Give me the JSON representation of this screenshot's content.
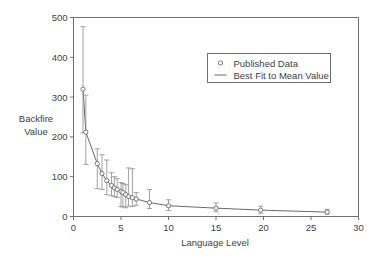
{
  "chart_data": {
    "type": "scatter",
    "title": "",
    "xlabel": "Language Level",
    "ylabel_line1": "Backfire",
    "ylabel_line2": "Value",
    "xlim": [
      0,
      30
    ],
    "ylim": [
      0,
      500
    ],
    "xticks": [
      0,
      5,
      10,
      15,
      20,
      25,
      30
    ],
    "xticklabels": [
      "0",
      "5",
      "10",
      "15",
      "20",
      "25",
      "30"
    ],
    "yticks": [
      0,
      100,
      200,
      300,
      400,
      500
    ],
    "yticklabels": [
      "0",
      "100",
      "200",
      "300",
      "400",
      "500"
    ],
    "grid": false,
    "legend_position": "upper right",
    "legend": [
      {
        "label": "Published Data",
        "marker": "circle-open"
      },
      {
        "label": "Best Fit to Mean Value",
        "marker": "line"
      }
    ],
    "series": [
      {
        "name": "Published Data",
        "marker": "circle-open",
        "points": [
          {
            "x": 1.0,
            "y": 320,
            "ylow": 210,
            "yhigh": 477
          },
          {
            "x": 1.3,
            "y": 212,
            "ylow": 131,
            "yhigh": 305
          },
          {
            "x": 2.5,
            "y": 133,
            "ylow": 70,
            "yhigh": 170
          },
          {
            "x": 3.0,
            "y": 108,
            "ylow": 68,
            "yhigh": 155
          },
          {
            "x": 3.5,
            "y": 90,
            "ylow": 55,
            "yhigh": 142
          },
          {
            "x": 4.0,
            "y": 78,
            "ylow": 52,
            "yhigh": 110
          },
          {
            "x": 4.3,
            "y": 72,
            "ylow": 50,
            "yhigh": 100
          },
          {
            "x": 4.6,
            "y": 68,
            "ylow": 48,
            "yhigh": 95
          },
          {
            "x": 5.0,
            "y": 63,
            "ylow": 25,
            "yhigh": 85
          },
          {
            "x": 5.2,
            "y": 60,
            "ylow": 24,
            "yhigh": 83
          },
          {
            "x": 5.5,
            "y": 55,
            "ylow": 22,
            "yhigh": 80
          },
          {
            "x": 5.8,
            "y": 50,
            "ylow": 26,
            "yhigh": 122
          },
          {
            "x": 6.2,
            "y": 47,
            "ylow": 25,
            "yhigh": 120
          },
          {
            "x": 6.6,
            "y": 44,
            "ylow": 28,
            "yhigh": 60
          },
          {
            "x": 8.0,
            "y": 35,
            "ylow": 20,
            "yhigh": 68
          },
          {
            "x": 10.0,
            "y": 27,
            "ylow": 15,
            "yhigh": 42
          },
          {
            "x": 15.0,
            "y": 21,
            "ylow": 12,
            "yhigh": 34
          },
          {
            "x": 19.7,
            "y": 16,
            "ylow": 8,
            "yhigh": 26
          },
          {
            "x": 26.7,
            "y": 11,
            "ylow": 6,
            "yhigh": 18
          }
        ]
      },
      {
        "name": "Best Fit to Mean Value",
        "marker": "line",
        "points": [
          {
            "x": 1.0,
            "y": 320
          },
          {
            "x": 1.3,
            "y": 212
          },
          {
            "x": 2.5,
            "y": 133
          },
          {
            "x": 3.0,
            "y": 108
          },
          {
            "x": 3.5,
            "y": 90
          },
          {
            "x": 4.0,
            "y": 78
          },
          {
            "x": 4.3,
            "y": 72
          },
          {
            "x": 4.6,
            "y": 68
          },
          {
            "x": 5.0,
            "y": 63
          },
          {
            "x": 5.2,
            "y": 60
          },
          {
            "x": 5.5,
            "y": 55
          },
          {
            "x": 5.8,
            "y": 50
          },
          {
            "x": 6.2,
            "y": 47
          },
          {
            "x": 6.6,
            "y": 44
          },
          {
            "x": 8.0,
            "y": 35
          },
          {
            "x": 10.0,
            "y": 27
          },
          {
            "x": 15.0,
            "y": 21
          },
          {
            "x": 19.7,
            "y": 16
          },
          {
            "x": 26.7,
            "y": 11
          }
        ]
      }
    ]
  }
}
